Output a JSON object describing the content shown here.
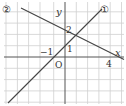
{
  "graph": {
    "axes": {
      "x_label": "x",
      "y_label": "y",
      "origin_label": "O"
    },
    "tick_labels": {
      "x_neg1": "−1",
      "x_4": "4",
      "y_1": "1",
      "y_2": "2"
    },
    "lines": [
      {
        "id": "1",
        "label": "①",
        "equation": "y = x + 1",
        "points": [
          [
            -1,
            0
          ],
          [
            0,
            1
          ]
        ]
      },
      {
        "id": "2",
        "label": "②",
        "equation": "y = -x/2 + 2",
        "points": [
          [
            0,
            2
          ],
          [
            4,
            0
          ]
        ]
      }
    ],
    "grid": {
      "x_range": [
        -5,
        5
      ],
      "y_range": [
        -4,
        4
      ],
      "unit": 1
    },
    "colors": {
      "grid": "#c8c8c8",
      "axis": "#555555",
      "line": "#444444"
    }
  }
}
